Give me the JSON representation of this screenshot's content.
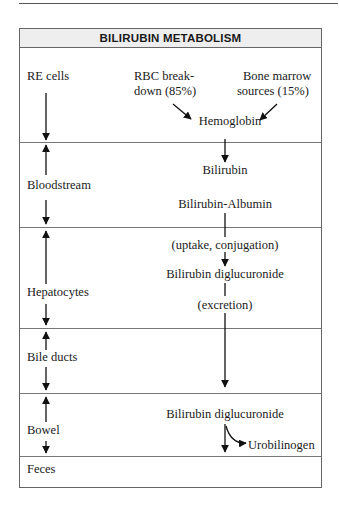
{
  "title": "BILIRUBIN METABOLISM",
  "sections": [
    {
      "label": "RE cells"
    },
    {
      "label": "Bloodstream"
    },
    {
      "label": "Hepatocytes"
    },
    {
      "label": "Bile ducts"
    },
    {
      "label": "Bowel"
    },
    {
      "label": "Feces"
    }
  ],
  "sources": {
    "rbc": {
      "line1": "RBC break-",
      "line2": "down (85%)"
    },
    "marrow": {
      "line1": "Bone marrow",
      "line2": "sources (15%)"
    }
  },
  "flow": {
    "hemoglobin": "Hemoglobin",
    "bilirubin": "Bilirubin",
    "bilirubin_albumin": "Bilirubin-Albumin",
    "uptake": "(uptake, conjugation)",
    "diglucuronide": "Bilirubin diglucuronide",
    "excretion": "(excretion)",
    "bowel_diglucuronide": "Bilirubin diglucuronide",
    "urobilinogen": "Urobilinogen"
  },
  "colors": {
    "header_bg": "#eeeeee",
    "border": "#666666",
    "text": "#1a1a1a"
  }
}
